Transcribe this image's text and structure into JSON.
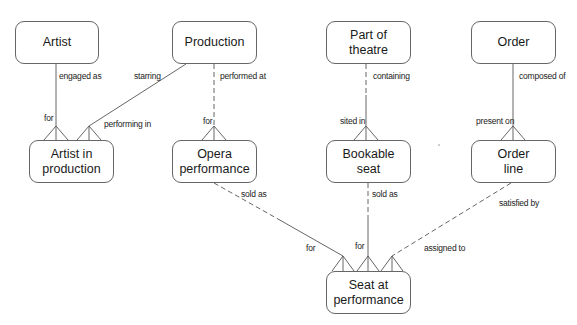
{
  "diagram": {
    "type": "entity-relationship",
    "entities": [
      {
        "id": "artist",
        "label": "Artist",
        "x": 15,
        "y": 21,
        "w": 84,
        "h": 43
      },
      {
        "id": "production",
        "label": "Production",
        "x": 172,
        "y": 21,
        "w": 85,
        "h": 43
      },
      {
        "id": "part_of_theatre",
        "label": "Part of\ntheatre",
        "x": 326,
        "y": 21,
        "w": 85,
        "h": 43
      },
      {
        "id": "order",
        "label": "Order",
        "x": 471,
        "y": 21,
        "w": 85,
        "h": 43
      },
      {
        "id": "artist_in_production",
        "label": "Artist in\nproduction",
        "x": 29,
        "y": 140,
        "w": 85,
        "h": 43
      },
      {
        "id": "opera_performance",
        "label": "Opera\nperformance",
        "x": 172,
        "y": 140,
        "w": 85,
        "h": 43
      },
      {
        "id": "bookable_seat",
        "label": "Bookable\nseat",
        "x": 326,
        "y": 140,
        "w": 85,
        "h": 43
      },
      {
        "id": "order_line",
        "label": "Order\nline",
        "x": 471,
        "y": 140,
        "w": 85,
        "h": 43
      },
      {
        "id": "seat_at_performance",
        "label": "Seat at\nperformance",
        "x": 326,
        "y": 271,
        "w": 85,
        "h": 43
      }
    ],
    "relationships": [
      {
        "from": "artist",
        "to": "artist_in_production",
        "from_label": "engaged as",
        "to_label": "for",
        "style": "solid"
      },
      {
        "from": "production",
        "to": "artist_in_production",
        "from_label": "starring",
        "to_label": "performing in",
        "style": "solid"
      },
      {
        "from": "production",
        "to": "opera_performance",
        "from_label": "performed at",
        "to_label": "for",
        "style": "dashed"
      },
      {
        "from": "part_of_theatre",
        "to": "bookable_seat",
        "from_label": "containing",
        "to_label": "sited in",
        "style": "dashed-solid"
      },
      {
        "from": "order",
        "to": "order_line",
        "from_label": "composed of",
        "to_label": "present on",
        "style": "solid"
      },
      {
        "from": "opera_performance",
        "to": "seat_at_performance",
        "from_label": "sold as",
        "to_label": "for",
        "style": "dashed-solid"
      },
      {
        "from": "bookable_seat",
        "to": "seat_at_performance",
        "from_label": "sold as",
        "to_label": "for",
        "style": "dashed-solid"
      },
      {
        "from": "order_line",
        "to": "seat_at_performance",
        "from_label": "satisfied by",
        "to_label": "assigned to",
        "style": "dashed"
      }
    ]
  },
  "labels": {
    "engaged_as": "engaged as",
    "for_artist": "for",
    "starring": "starring",
    "performing_in": "performing in",
    "performed_at": "performed at",
    "for_opera": "for",
    "containing": "containing",
    "sited_in": "sited in",
    "composed_of": "composed of",
    "present_on": "present on",
    "sold_as_opera": "sold as",
    "sold_as_seat": "sold as",
    "satisfied_by": "satisfied by",
    "for_seat_1": "for",
    "for_seat_2": "for",
    "assigned_to": "assigned to"
  },
  "entity_labels": {
    "artist": "Artist",
    "production": "Production",
    "part_of_theatre": "Part of\ntheatre",
    "order": "Order",
    "artist_in_production": "Artist in\nproduction",
    "opera_performance": "Opera\nperformance",
    "bookable_seat": "Bookable\nseat",
    "order_line": "Order\nline",
    "seat_at_performance": "Seat at\nperformance"
  }
}
